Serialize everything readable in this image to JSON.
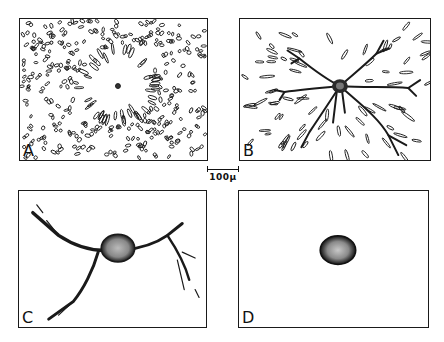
{
  "figure": {
    "panels": [
      {
        "id": "A",
        "label": "A",
        "description": "Dense field of scattered short elongated fragments with a small radial clearing around a tiny central dark cell body"
      },
      {
        "id": "B",
        "label": "B",
        "description": "Cell with dark central body and several long branching processes extending outward, scattered fragments in periphery"
      },
      {
        "id": "C",
        "label": "C",
        "description": "Bipolar/tripolar cell with large stippled cell body and a few tapering branched processes"
      },
      {
        "id": "D",
        "label": "D",
        "description": "Isolated rounded stippled cell body with no processes"
      }
    ],
    "scale_bar": {
      "label": "100μ"
    }
  },
  "colors": {
    "ink": "#1a1a1a",
    "background": "#ffffff",
    "stipple": "#555555"
  }
}
